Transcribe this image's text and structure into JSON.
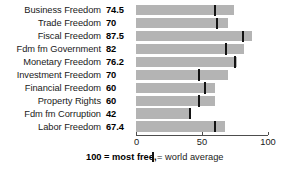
{
  "chart_data": {
    "type": "bar",
    "orientation": "horizontal",
    "title": "",
    "xlabel": "",
    "ylabel": "",
    "xlim": [
      0,
      100
    ],
    "grid": false,
    "categories": [
      "Business Freedom",
      "Trade Freedom",
      "Fiscal Freedom",
      "Fdm fm Government",
      "Monetary Freedom",
      "Investment Freedom",
      "Financial Freedom",
      "Property Rights",
      "Fdm fm Corruption",
      "Labor Freedom"
    ],
    "values": [
      74.5,
      70,
      87.5,
      82,
      76.2,
      70,
      60,
      60,
      42,
      67.4
    ],
    "value_labels": [
      "74.5",
      "70",
      "87.5",
      "82",
      "76.2",
      "70",
      "60",
      "60",
      "42",
      "67.4"
    ],
    "series": [
      {
        "name": "Country score",
        "values": [
          74.5,
          70,
          87.5,
          82,
          76.2,
          70,
          60,
          60,
          42,
          67.4
        ]
      },
      {
        "name": "world average",
        "type": "marker",
        "values": [
          60,
          61,
          81,
          68,
          75,
          48,
          52,
          48,
          41,
          60
        ]
      }
    ],
    "axis_ticks": [
      0,
      50,
      100
    ],
    "axis_tick_labels": [
      "0",
      "50",
      "100"
    ],
    "legend": {
      "position": "bottom",
      "most_free_note": "100 = most free,",
      "world_average_label": "= world average",
      "world_average_glyph": "world-average-tick-icon"
    },
    "colors": {
      "bar": "#b4b4b4",
      "marker": "#141414",
      "axis": "#4d4d4d",
      "text": "#1a1a1a",
      "background": "#ffffff"
    }
  },
  "rows": [
    {
      "label": "Business Freedom",
      "value": "74.5",
      "value_num": 74.5,
      "avg": 60
    },
    {
      "label": "Trade Freedom",
      "value": "70",
      "value_num": 70,
      "avg": 61
    },
    {
      "label": "Fiscal Freedom",
      "value": "87.5",
      "value_num": 87.5,
      "avg": 81
    },
    {
      "label": "Fdm fm Government",
      "value": "82",
      "value_num": 82,
      "avg": 68
    },
    {
      "label": "Monetary Freedom",
      "value": "76.2",
      "value_num": 76.2,
      "avg": 75
    },
    {
      "label": "Investment Freedom",
      "value": "70",
      "value_num": 70,
      "avg": 48
    },
    {
      "label": "Financial Freedom",
      "value": "60",
      "value_num": 60,
      "avg": 52
    },
    {
      "label": "Property Rights",
      "value": "60",
      "value_num": 60,
      "avg": 48
    },
    {
      "label": "Fdm fm Corruption",
      "value": "42",
      "value_num": 42,
      "avg": 41
    },
    {
      "label": "Labor Freedom",
      "value": "67.4",
      "value_num": 67.4,
      "avg": 60
    }
  ],
  "axis": {
    "ticks": [
      {
        "value": 0,
        "label": "0"
      },
      {
        "value": 50,
        "label": "50"
      },
      {
        "value": 100,
        "label": "100"
      }
    ]
  },
  "legend": {
    "most_free": "100 = most free,",
    "world_average": "= world average"
  }
}
